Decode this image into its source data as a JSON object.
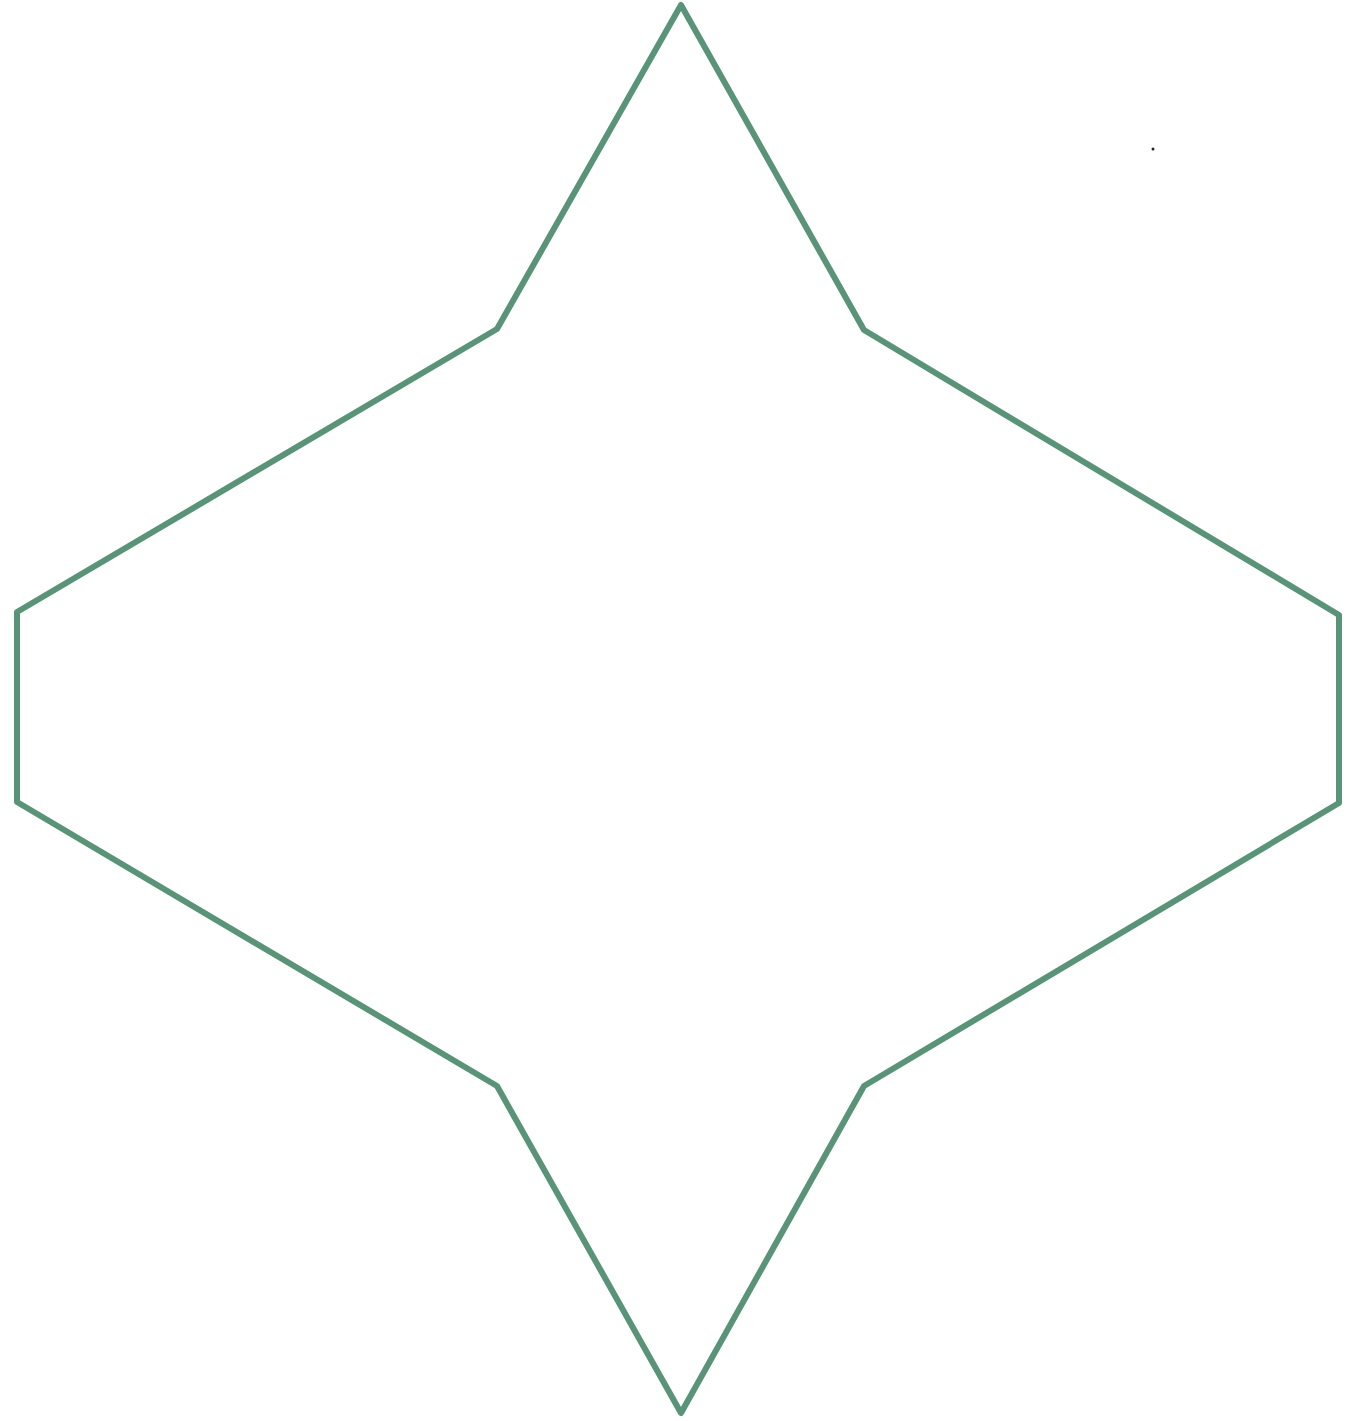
{
  "canvas": {
    "width": 1363,
    "height": 1421,
    "background": "#ffffff"
  },
  "shape": {
    "type": "polygon",
    "description": "ten-vertex star-like outline (elongated four-point star / hexagon with pointed top and bottom)",
    "stroke_color": "#5a9478",
    "stroke_width": 6,
    "fill": "none",
    "points": [
      [
        681,
        5
      ],
      [
        864,
        330
      ],
      [
        1339,
        615
      ],
      [
        1339,
        803
      ],
      [
        864,
        1086
      ],
      [
        681,
        1413
      ],
      [
        497,
        1086
      ],
      [
        17,
        802
      ],
      [
        17,
        612
      ],
      [
        497,
        329
      ]
    ]
  },
  "marker": {
    "type": "dot",
    "x": 1153,
    "y": 149,
    "radius": 1.5,
    "color": "#222222"
  }
}
